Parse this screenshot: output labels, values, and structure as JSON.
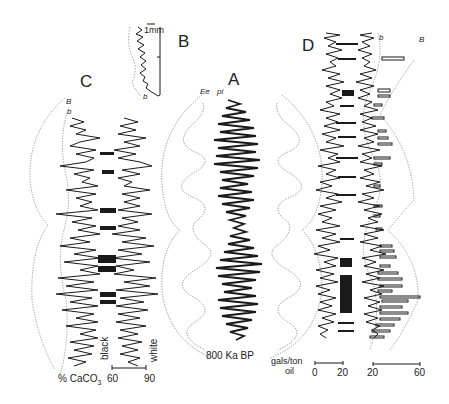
{
  "panels": {
    "A": {
      "letter": "A",
      "curve_labels": [
        "Ee",
        "pi"
      ],
      "age_label": "800 Ka BP"
    },
    "B": {
      "letter": "B",
      "scale_label": "1mm",
      "curve_label": "b"
    },
    "C": {
      "letter": "C",
      "curve_labels": [
        "B",
        "b"
      ],
      "axis_title": "% CaCO3",
      "axis_title_main": "% CaCO",
      "axis_title_sub": "3",
      "ticks": [
        "60",
        "90"
      ],
      "side_labels": [
        "black",
        "white"
      ]
    },
    "D": {
      "letter": "D",
      "curve_labels": [
        "b",
        "B"
      ],
      "axis_title_line1": "gals/ton",
      "axis_title_line2": "oil",
      "scale1_ticks": [
        "0",
        "20"
      ],
      "scale2_ticks": [
        "20",
        "60"
      ]
    }
  },
  "colors": {
    "ink": "#1a1a1a",
    "dotted": "#888888",
    "background": "#ffffff"
  }
}
